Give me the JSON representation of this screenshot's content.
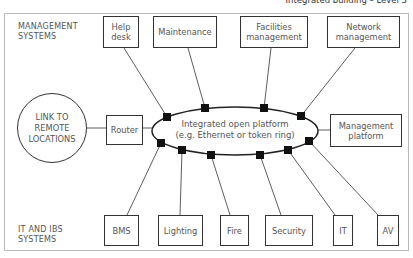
{
  "header": {
    "title": "Integrated building – Level 3"
  },
  "labels": {
    "management_systems": "MANAGEMENT\nSYSTEMS",
    "it_ibs_systems": "IT AND IBS\nSYSTEMS"
  },
  "management_boxes": [
    {
      "label": "Help\ndesk"
    },
    {
      "label": "Maintenance"
    },
    {
      "label": "Facilities\nmanagement"
    },
    {
      "label": "Network\nmanagement"
    }
  ],
  "remote": {
    "label": "LINK TO\nREMOTE\nLOCATIONS"
  },
  "router": {
    "label": "Router"
  },
  "platform": {
    "label": "Integrated open platform\n(e.g. Ethernet or token ring)"
  },
  "management_platform": {
    "label": "Management\nplatform"
  },
  "system_boxes": [
    {
      "label": "BMS"
    },
    {
      "label": "Lighting"
    },
    {
      "label": "Fire"
    },
    {
      "label": "Security"
    },
    {
      "label": "IT"
    },
    {
      "label": "AV"
    }
  ],
  "colors": {
    "line": "#333333",
    "frame": "#bbbbbb",
    "text": "#555555"
  }
}
